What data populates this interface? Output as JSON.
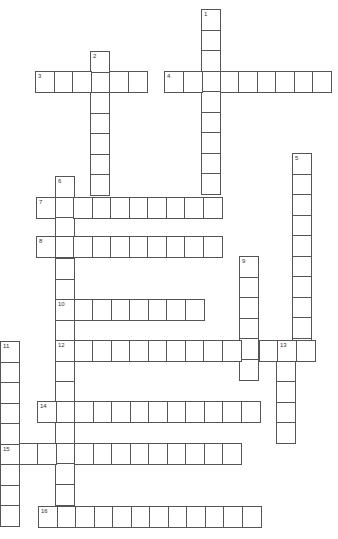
{
  "puzzle": {
    "type": "crossword",
    "cell_width": 18.5,
    "cell_height": 20.5,
    "border_color": "#555555",
    "background": "#ffffff",
    "clues": [
      {
        "number": "1",
        "direction": "down",
        "x": 201,
        "y": 9,
        "length": 9
      },
      {
        "number": "2",
        "direction": "down",
        "x": 90,
        "y": 51,
        "length": 7
      },
      {
        "number": "3",
        "direction": "across",
        "x": 35,
        "y": 71,
        "length": 6
      },
      {
        "number": "4",
        "direction": "across",
        "x": 164,
        "y": 71,
        "length": 9
      },
      {
        "number": "5",
        "direction": "down",
        "x": 292,
        "y": 153,
        "length": 10
      },
      {
        "number": "6",
        "direction": "down",
        "x": 55,
        "y": 176,
        "length": 16
      },
      {
        "number": "7",
        "direction": "across",
        "x": 36,
        "y": 197,
        "length": 10
      },
      {
        "number": "8",
        "direction": "across",
        "x": 36,
        "y": 236,
        "length": 10
      },
      {
        "number": "9",
        "direction": "down",
        "x": 239,
        "y": 256,
        "length": 6
      },
      {
        "number": "10",
        "direction": "across",
        "x": 55,
        "y": 299,
        "length": 8
      },
      {
        "number": "11",
        "direction": "down",
        "x": 0,
        "y": 341,
        "length": 9
      },
      {
        "number": "12",
        "direction": "across",
        "x": 55,
        "y": 340,
        "length": 14
      },
      {
        "number": "13",
        "direction": "down",
        "x": 276,
        "y": 340,
        "length": 5
      },
      {
        "number": "14",
        "direction": "across",
        "x": 37,
        "y": 401,
        "length": 12
      },
      {
        "number": "15",
        "direction": "across",
        "x": 0,
        "y": 443,
        "length": 13
      },
      {
        "number": "16",
        "direction": "across",
        "x": 38,
        "y": 506,
        "length": 12
      }
    ]
  }
}
